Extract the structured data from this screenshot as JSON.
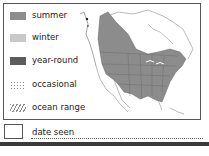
{
  "legend": {
    "items": [
      {
        "label": "summer",
        "color": "#8c8c8c",
        "pattern": "solid"
      },
      {
        "label": "winter",
        "color": "#c8c8c8",
        "pattern": "solid"
      },
      {
        "label": "year-round",
        "color": "#5c5c5c",
        "pattern": "solid"
      },
      {
        "label": "occasional",
        "color": "#8c8c8c",
        "pattern": "dotted"
      },
      {
        "label": "ocean range",
        "color": "#8c8c8c",
        "pattern": "hatched"
      }
    ]
  },
  "map": {
    "region": "North America",
    "range_color": "#8c8c8c",
    "border_color": "#666666"
  },
  "date_seen": {
    "label": "date seen",
    "value": ""
  }
}
